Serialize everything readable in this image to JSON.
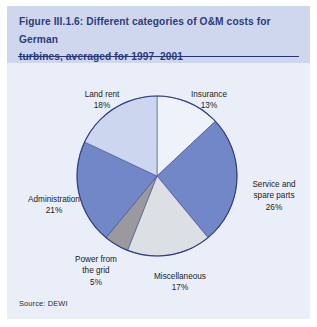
{
  "figure": {
    "title": "Figure III.1.6: Different categories of O&M costs for German turbines, averaged for 1997–2001",
    "title_line_1": "Figure III.1.6: Different categories of O&M costs for German",
    "title_line_2": "turbines, averaged for 1997–2001",
    "source": "Source: DEWI"
  },
  "labels": {
    "land_rent": {
      "name": "Land rent",
      "pct": "18%"
    },
    "insurance": {
      "name": "Insurance",
      "pct": "13%"
    },
    "service": {
      "name_line_1": "Service and",
      "name_line_2": "spare parts",
      "pct": "26%"
    },
    "administration": {
      "name": "Administration",
      "pct": "21%"
    },
    "power_grid": {
      "name_line_1": "Power from",
      "name_line_2": "the grid",
      "pct": "5%"
    },
    "miscellaneous": {
      "name": "Miscellaneous",
      "pct": "17%"
    }
  },
  "colors": {
    "page_background": "#ffffff",
    "panel_background": "#e9eef8",
    "header_background": "#ced7ee",
    "title_text": "#2d3c7a",
    "title_rule": "#26347a",
    "pie_outline": "#2f3f80",
    "slice_insurance": "#eef2fa",
    "slice_service": "#7187c8",
    "slice_miscellaneous": "#dcdfe4",
    "slice_power_grid": "#9a9a9e",
    "slice_administration": "#7187c8",
    "slice_land_rent": "#ccd6ef"
  },
  "chart_data": {
    "type": "pie",
    "title": "Different categories of O&M costs for German turbines, averaged for 1997–2001",
    "unit": "percent",
    "total": 100,
    "start_angle_deg": 0,
    "direction": "clockwise",
    "legend": "none (slices labelled directly)",
    "labels": [
      "Insurance",
      "Service and spare parts",
      "Miscellaneous",
      "Power from the grid",
      "Administration",
      "Land rent"
    ],
    "values": [
      13,
      26,
      17,
      5,
      21,
      18
    ],
    "slice_colors": [
      "#eef2fa",
      "#7187c8",
      "#dcdfe4",
      "#9a9a9e",
      "#7187c8",
      "#ccd6ef"
    ],
    "slices": [
      {
        "label": "Insurance",
        "value": 13,
        "color": "#eef2fa"
      },
      {
        "label": "Service and spare parts",
        "value": 26,
        "color": "#7187c8"
      },
      {
        "label": "Miscellaneous",
        "value": 17,
        "color": "#dcdfe4"
      },
      {
        "label": "Power from the grid",
        "value": 5,
        "color": "#9a9a9e"
      },
      {
        "label": "Administration",
        "value": 21,
        "color": "#7187c8"
      },
      {
        "label": "Land rent",
        "value": 18,
        "color": "#ccd6ef"
      }
    ]
  },
  "geometry": {
    "center_x": 150,
    "center_y": 110,
    "radius": 80
  }
}
